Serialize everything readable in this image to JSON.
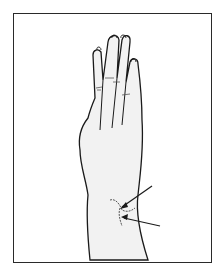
{
  "figure": {
    "frame_color": "#2a2a2a",
    "line_color": "#1a1a1a",
    "skin_fill": "#f2f2f2",
    "annotations": {
      "arrow_count": 2,
      "target": "wrist"
    }
  }
}
